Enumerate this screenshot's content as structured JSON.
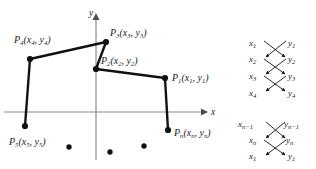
{
  "figure": {
    "background_color": "#ffffff",
    "ink_color": "#111111",
    "axis_color": "#8a8a8a"
  },
  "axes": {
    "x_label": "x",
    "y_label": "y",
    "origin": {
      "x": 96,
      "y": 112
    },
    "x_axis": {
      "x1": 4,
      "y1": 112,
      "x2": 208,
      "y2": 112,
      "arrow": "right"
    },
    "y_axis": {
      "x1": 96,
      "y1": 160,
      "x2": 96,
      "y2": 14,
      "arrow": "up"
    }
  },
  "polyline": {
    "label_prefix": "P",
    "stroke_width": 2.4,
    "vertices": [
      {
        "name": "P1",
        "label": "P",
        "index": "1",
        "coords": "(x₁, y₁)",
        "index_text": "1",
        "arg_x": "x",
        "arg_x_sub": "1",
        "arg_y": "y",
        "arg_y_sub": "1",
        "px": 165,
        "py": 78,
        "label_x": 172,
        "label_y": 76,
        "anchor": "start"
      },
      {
        "name": "P2",
        "label": "P",
        "index": "2",
        "coords": "(x₂, y₂)",
        "index_text": "2",
        "arg_x": "x",
        "arg_x_sub": "2",
        "arg_y": "y",
        "arg_y_sub": "2",
        "px": 96,
        "py": 69,
        "label_x": 101,
        "label_y": 63,
        "anchor": "start"
      },
      {
        "name": "P3",
        "label": "P",
        "index": "3",
        "coords": "(x₃, y₃)",
        "index_text": "3",
        "arg_x": "x",
        "arg_x_sub": "3",
        "arg_y": "y",
        "arg_y_sub": "3",
        "px": 106,
        "py": 42,
        "label_x": 110,
        "label_y": 36,
        "anchor": "start"
      },
      {
        "name": "P4",
        "label": "P",
        "index": "4",
        "coords": "(x₄, y₄)",
        "index_text": "4",
        "arg_x": "x",
        "arg_x_sub": "4",
        "arg_y": "y",
        "arg_y_sub": "4",
        "px": 30,
        "py": 59,
        "label_x": 14,
        "label_y": 43,
        "anchor": "start"
      },
      {
        "name": "P5",
        "label": "P",
        "index": "5",
        "coords": "(x₅, y₅)",
        "index_text": "5",
        "arg_x": "x",
        "arg_x_sub": "5",
        "arg_y": "y",
        "arg_y_sub": "5",
        "px": 25,
        "py": 126,
        "label_x": 9,
        "label_y": 142,
        "anchor": "start"
      },
      {
        "name": "Pn",
        "label": "P",
        "index": "n",
        "coords": "(xₙ, yₙ)",
        "index_text": "n",
        "arg_x": "x",
        "arg_x_sub": "n",
        "arg_y": "y",
        "arg_y_sub": "n",
        "px": 168,
        "py": 130,
        "label_x": 174,
        "label_y": 135,
        "anchor": "start"
      }
    ],
    "segments": [
      {
        "from": "P5",
        "to": "P4"
      },
      {
        "from": "P4",
        "to": "P3"
      },
      {
        "from": "P3",
        "to": "P2"
      },
      {
        "from": "P2",
        "to": "P1"
      },
      {
        "from": "P1",
        "to": "Pn"
      }
    ]
  },
  "ellipsis_dots": [
    {
      "cx": 69,
      "cy": 147
    },
    {
      "cx": 110,
      "cy": 152
    },
    {
      "cx": 144,
      "cy": 146
    }
  ],
  "crossing_diagram": {
    "caption": "coordinate interleave crossings",
    "left_column_x": 263,
    "right_column_x": 290,
    "groups": [
      {
        "name": "top-group",
        "rows": [
          {
            "left": "x",
            "left_sub": "1",
            "right": "y",
            "right_sub": "1",
            "y": 43
          },
          {
            "left": "x",
            "left_sub": "2",
            "right": "y",
            "right_sub": "2",
            "y": 58
          },
          {
            "left": "x",
            "left_sub": "3",
            "right": "y",
            "right_sub": "3",
            "y": 76
          },
          {
            "left": "x",
            "left_sub": "4",
            "right": "y",
            "right_sub": "4",
            "y": 93
          }
        ],
        "crossings": [
          {
            "from_row": 0,
            "to_row": 1
          },
          {
            "from_row": 1,
            "to_row": 2
          },
          {
            "from_row": 2,
            "to_row": 3
          }
        ]
      },
      {
        "name": "bottom-group",
        "rows": [
          {
            "left": "x",
            "left_sub": "n−1",
            "right": "y",
            "right_sub": "n−1",
            "y": 124
          },
          {
            "left": "x",
            "left_sub": "n",
            "right": "y",
            "right_sub": "n",
            "y": 140
          },
          {
            "left": "x",
            "left_sub": "1",
            "right": "y",
            "right_sub": "1",
            "y": 156
          }
        ],
        "crossings": [
          {
            "from_row": 0,
            "to_row": 1
          },
          {
            "from_row": 1,
            "to_row": 2
          }
        ]
      }
    ]
  }
}
